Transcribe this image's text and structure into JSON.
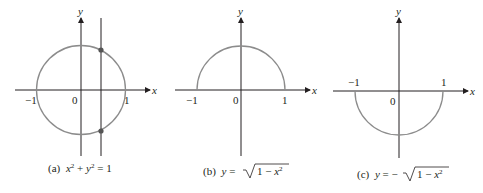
{
  "figures": [
    {
      "id": "a",
      "caption_prefix": "(a)",
      "caption_formula": "x² + y² = 1",
      "axis_x_label": "x",
      "axis_y_label": "y",
      "ticks": {
        "neg_one": "−1",
        "zero": "0",
        "one": "1"
      },
      "curve": "full circle",
      "extras": "vertical line at x≈0.45 intersecting circle at two points"
    },
    {
      "id": "b",
      "caption_prefix": "(b)",
      "caption_formula": "y = √(1 − x²)",
      "axis_x_label": "x",
      "axis_y_label": "y",
      "ticks": {
        "neg_one": "−1",
        "zero": "0",
        "one": "1"
      },
      "curve": "upper semicircle"
    },
    {
      "id": "c",
      "caption_prefix": "(c)",
      "caption_formula": "y = −√(1 − x²)",
      "axis_x_label": "x",
      "axis_y_label": "y",
      "ticks": {
        "neg_one": "−1",
        "zero": "0",
        "one": "1"
      },
      "curve": "lower semicircle"
    }
  ],
  "colors": {
    "axis": "#231f20",
    "curve": "#8c8c8c",
    "point": "#555555"
  }
}
